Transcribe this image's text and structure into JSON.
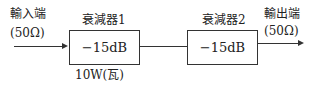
{
  "input": {
    "label": "輸入端",
    "impedance": "(50Ω)"
  },
  "output": {
    "label": "輸出端",
    "impedance": "(50Ω)"
  },
  "attenuator1": {
    "title": "衰減器1",
    "value": "−15dB",
    "power": "10W(瓦)"
  },
  "attenuator2": {
    "title": "衰減器2",
    "value": "−15dB"
  }
}
